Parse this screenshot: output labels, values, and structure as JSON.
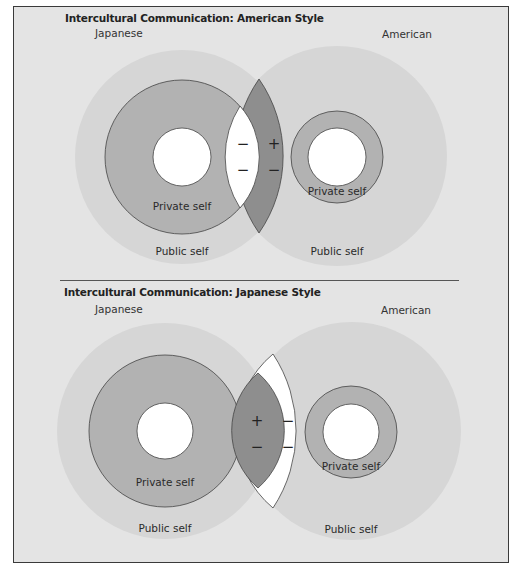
{
  "colors": {
    "page_bg": "#ffffff",
    "panel_bg": "#e4e4e4",
    "border": "#3a3a3a",
    "public_self": "#d6d6d6",
    "private_self": "#b2b2b2",
    "core": "#ffffff",
    "lens_dark": "#8e8e8e",
    "lens_white": "#ffffff",
    "stroke": "#444444"
  },
  "panels": [
    {
      "title": "Intercultural Communication: American Style",
      "left_label": "Japanese",
      "right_label": "American",
      "left": {
        "private_label": "Private self",
        "public_label": "Public self"
      },
      "right": {
        "private_label": "Private self",
        "public_label": "Public self"
      },
      "symbols": {
        "left_top": "−",
        "left_bottom": "−",
        "right_top": "+",
        "right_bottom": "−"
      }
    },
    {
      "title": "Intercultural Communication: Japanese Style",
      "left_label": "Japanese",
      "right_label": "American",
      "left": {
        "private_label": "Private self",
        "public_label": "Public self"
      },
      "right": {
        "private_label": "Private self",
        "public_label": "Public self"
      },
      "symbols": {
        "left_top": "+",
        "left_bottom": "−",
        "right_top": "−",
        "right_bottom": "−"
      }
    }
  ]
}
